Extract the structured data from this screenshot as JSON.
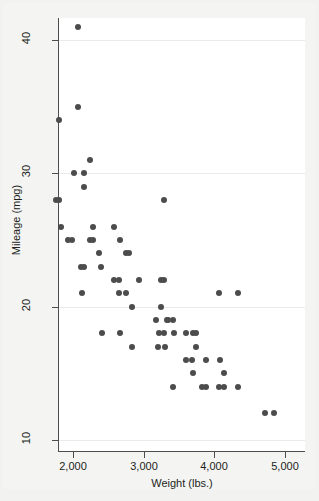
{
  "chart_data": {
    "type": "scatter",
    "title": "",
    "xlabel": "Weight (lbs.)",
    "ylabel": "Mileage (mpg)",
    "xlim": [
      1690,
      5000
    ],
    "ylim": [
      9.5,
      42
    ],
    "xticks": [
      2000,
      3000,
      4000,
      5000
    ],
    "xtick_labels": [
      "2,000",
      "3,000",
      "4,000",
      "5,000"
    ],
    "yticks": [
      10,
      20,
      30,
      40
    ],
    "ytick_labels": [
      "10",
      "20",
      "30",
      "40"
    ],
    "grid": "horizontal",
    "legend": "none",
    "marker_color": "#4c4c4c",
    "marker_size": 6,
    "points": [
      {
        "x": 2070,
        "y": 41
      },
      {
        "x": 2070,
        "y": 35
      },
      {
        "x": 1800,
        "y": 34
      },
      {
        "x": 2240,
        "y": 31
      },
      {
        "x": 2020,
        "y": 30
      },
      {
        "x": 2160,
        "y": 30
      },
      {
        "x": 2160,
        "y": 29
      },
      {
        "x": 1760,
        "y": 28
      },
      {
        "x": 1800,
        "y": 28
      },
      {
        "x": 3280,
        "y": 28
      },
      {
        "x": 1830,
        "y": 26
      },
      {
        "x": 2280,
        "y": 26
      },
      {
        "x": 2580,
        "y": 26
      },
      {
        "x": 1930,
        "y": 25
      },
      {
        "x": 1980,
        "y": 25
      },
      {
        "x": 2240,
        "y": 25
      },
      {
        "x": 2280,
        "y": 25
      },
      {
        "x": 2670,
        "y": 25
      },
      {
        "x": 2370,
        "y": 24
      },
      {
        "x": 2750,
        "y": 24
      },
      {
        "x": 2790,
        "y": 24
      },
      {
        "x": 2110,
        "y": 23
      },
      {
        "x": 2160,
        "y": 23
      },
      {
        "x": 2400,
        "y": 23
      },
      {
        "x": 2580,
        "y": 22
      },
      {
        "x": 2650,
        "y": 22
      },
      {
        "x": 2930,
        "y": 22
      },
      {
        "x": 3250,
        "y": 22
      },
      {
        "x": 3280,
        "y": 22
      },
      {
        "x": 2130,
        "y": 21
      },
      {
        "x": 2650,
        "y": 21
      },
      {
        "x": 2750,
        "y": 21
      },
      {
        "x": 4060,
        "y": 21
      },
      {
        "x": 4330,
        "y": 21
      },
      {
        "x": 2830,
        "y": 20
      },
      {
        "x": 3250,
        "y": 20
      },
      {
        "x": 3180,
        "y": 19
      },
      {
        "x": 3330,
        "y": 19
      },
      {
        "x": 3350,
        "y": 19
      },
      {
        "x": 3420,
        "y": 19
      },
      {
        "x": 2410,
        "y": 18
      },
      {
        "x": 2670,
        "y": 18
      },
      {
        "x": 3210,
        "y": 18
      },
      {
        "x": 3280,
        "y": 18
      },
      {
        "x": 3430,
        "y": 18
      },
      {
        "x": 3600,
        "y": 18
      },
      {
        "x": 3700,
        "y": 18
      },
      {
        "x": 3740,
        "y": 18
      },
      {
        "x": 2830,
        "y": 17
      },
      {
        "x": 3200,
        "y": 17
      },
      {
        "x": 3300,
        "y": 17
      },
      {
        "x": 3740,
        "y": 17
      },
      {
        "x": 3600,
        "y": 16
      },
      {
        "x": 3690,
        "y": 16
      },
      {
        "x": 3880,
        "y": 16
      },
      {
        "x": 4080,
        "y": 16
      },
      {
        "x": 3700,
        "y": 15
      },
      {
        "x": 4130,
        "y": 15
      },
      {
        "x": 3420,
        "y": 14
      },
      {
        "x": 3830,
        "y": 14
      },
      {
        "x": 3880,
        "y": 14
      },
      {
        "x": 4060,
        "y": 14
      },
      {
        "x": 4130,
        "y": 14
      },
      {
        "x": 4330,
        "y": 14
      },
      {
        "x": 4720,
        "y": 12
      },
      {
        "x": 4840,
        "y": 12
      }
    ]
  },
  "axes": {
    "x_title": "Weight (lbs.)",
    "y_title": "Mileage (mpg)",
    "x_tick_labels": [
      "2,000",
      "3,000",
      "4,000",
      "5,000"
    ],
    "y_tick_labels": [
      "40",
      "30",
      "20",
      "10"
    ]
  }
}
